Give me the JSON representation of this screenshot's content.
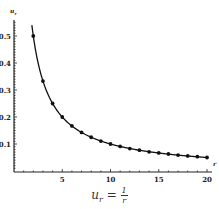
{
  "chart_data": {
    "type": "line",
    "title": "",
    "caption": {
      "lhs": "u",
      "sub": "r",
      "eq": " = ",
      "num": "1",
      "den": "r"
    },
    "xlabel": "r",
    "ylabel": "u_r",
    "xlim": [
      0,
      20
    ],
    "ylim": [
      0,
      0.55
    ],
    "x_ticks": [
      "5",
      "10",
      "15",
      "20"
    ],
    "y_ticks": [
      "0.1",
      "0.2",
      "0.3",
      "0.4",
      "0.5"
    ],
    "grid": false,
    "legend": null,
    "series": [
      {
        "name": "u_r = 1/r",
        "markers": true,
        "x": [
          2,
          3,
          4,
          5,
          6,
          7,
          8,
          9,
          10,
          11,
          12,
          13,
          14,
          15,
          16,
          17,
          18,
          19,
          20
        ],
        "y": [
          0.5,
          0.333,
          0.25,
          0.2,
          0.167,
          0.143,
          0.125,
          0.111,
          0.1,
          0.091,
          0.083,
          0.077,
          0.071,
          0.067,
          0.063,
          0.059,
          0.056,
          0.053,
          0.05
        ]
      }
    ]
  }
}
